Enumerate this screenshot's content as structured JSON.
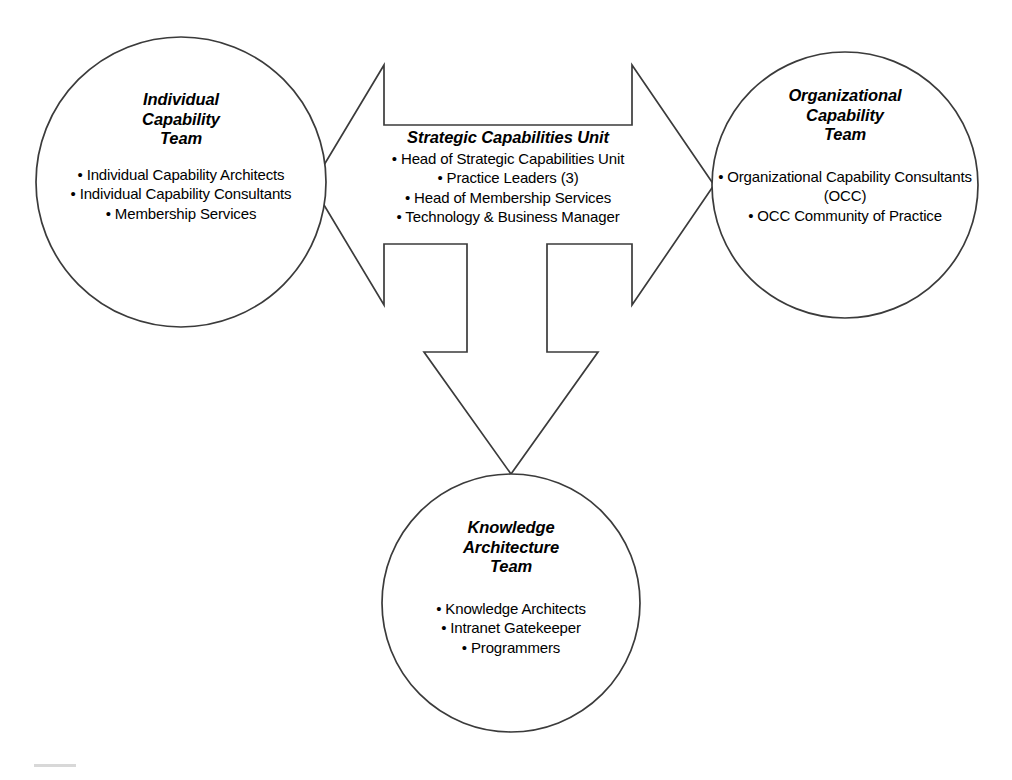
{
  "diagram": {
    "type": "organizational-structure",
    "background_color": "#ffffff",
    "stroke_color": "#3b3b3b",
    "nodes": {
      "individual_capability_team": {
        "shape": "circle",
        "title_lines": [
          "Individual",
          "Capability",
          "Team"
        ],
        "items": [
          "• Individual Capability Architects",
          "• Individual Capability Consultants",
          "• Membership Services"
        ]
      },
      "strategic_capabilities_unit": {
        "shape": "arrow-hub",
        "title_lines": [
          "Strategic Capabilities Unit"
        ],
        "items": [
          "• Head of Strategic Capabilities Unit",
          "• Practice Leaders (3)",
          "• Head of Membership Services",
          "• Technology & Business Manager"
        ]
      },
      "organizational_capability_team": {
        "shape": "circle",
        "title_lines": [
          "Organizational",
          "Capability",
          "Team"
        ],
        "items": [
          "• Organizational Capability Consultants (OCC)",
          "• OCC Community of Practice"
        ]
      },
      "knowledge_architecture_team": {
        "shape": "circle",
        "title_lines": [
          "Knowledge",
          "Architecture",
          "Team"
        ],
        "items": [
          "• Knowledge Architects",
          "• Intranet Gatekeeper",
          "• Programmers"
        ]
      }
    },
    "connectors": [
      {
        "name": "arrow-to-individual-capability-team",
        "direction": "left"
      },
      {
        "name": "arrow-to-organizational-capability-team",
        "direction": "right"
      },
      {
        "name": "arrow-to-knowledge-architecture-team",
        "direction": "down"
      }
    ]
  }
}
